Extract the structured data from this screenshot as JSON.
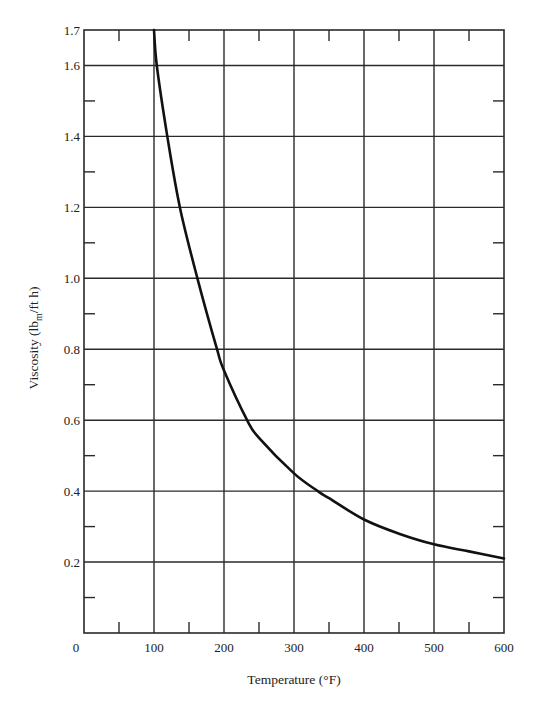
{
  "chart_data": {
    "type": "line",
    "title": "",
    "xlabel": "Temperature (°F)",
    "ylabel": "Viscosity (lb_m/ft h)",
    "ylabel_parts": {
      "prefix": "Viscosity (lb",
      "subscript": "m",
      "suffix": "/ft h)"
    },
    "xlim": [
      0,
      600
    ],
    "ylim": [
      0,
      1.7
    ],
    "grid": true,
    "x_ticks": [
      0,
      100,
      200,
      300,
      400,
      500,
      600
    ],
    "x_tick_labels": [
      "0",
      "100",
      "200",
      "300",
      "400",
      "500",
      "600"
    ],
    "x_minor_ticks": [
      50,
      150,
      250,
      350,
      450,
      550
    ],
    "y_ticks": [
      0.2,
      0.4,
      0.6,
      0.8,
      1.0,
      1.2,
      1.4,
      1.6,
      1.7
    ],
    "y_tick_labels": [
      "0.2",
      "0.4",
      "0.6",
      "0.8",
      "1.0",
      "1.2",
      "1.4",
      "1.6",
      "1.7"
    ],
    "y_minor_ticks": [
      0.1,
      0.3,
      0.5,
      0.7,
      0.9,
      1.1,
      1.3,
      1.5
    ],
    "legend": null,
    "series": [
      {
        "name": "Viscosity",
        "color": "#111111",
        "x": [
          100,
          104,
          119,
          137,
          162,
          190,
          200,
          233,
          250,
          300,
          334,
          350,
          400,
          450,
          500,
          550,
          600
        ],
        "y": [
          1.7,
          1.6,
          1.4,
          1.2,
          1.0,
          0.8,
          0.74,
          0.6,
          0.55,
          0.45,
          0.4,
          0.38,
          0.32,
          0.28,
          0.25,
          0.23,
          0.21
        ]
      }
    ]
  },
  "colors": {
    "background": "#ffffff",
    "grid": "#2a2a2a",
    "curve": "#111111",
    "text": "#222222"
  }
}
